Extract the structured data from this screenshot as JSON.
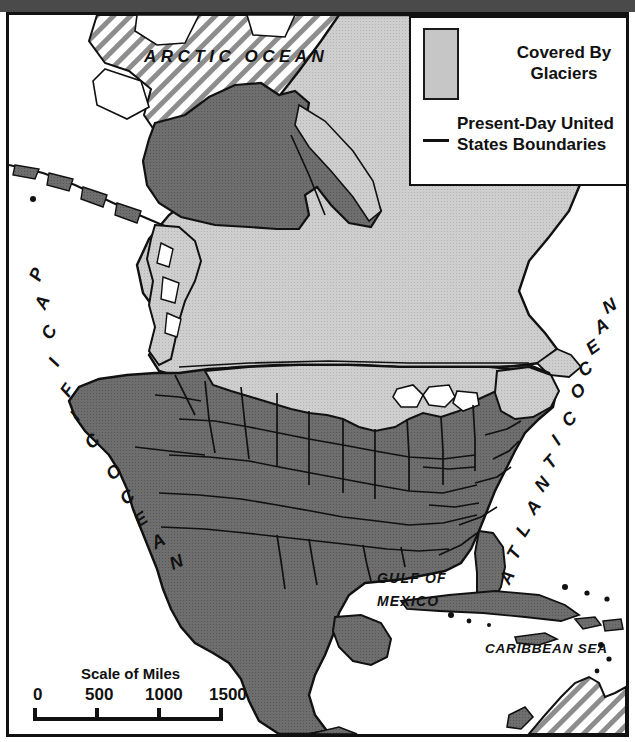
{
  "map": {
    "title": "Ice Age Glaciation of North America",
    "legend": {
      "glacier_label": "Covered By Glaciers",
      "glacier_label_line1": "Covered By",
      "glacier_label_line2": "Glaciers",
      "boundary_label": "Present-Day United States Boundaries",
      "boundary_label_line1": "Present-Day United",
      "boundary_label_line2": "States Boundaries"
    },
    "water_labels": {
      "arctic": "ARCTIC OCEAN",
      "pacific": "PACIFIC OCEAN",
      "pacific_word1": "PACIFIC",
      "pacific_word2": "OCEAN",
      "atlantic": "ATLANTIC OCEAN",
      "atlantic_word1": "ATLANTIC",
      "atlantic_word2": "OCEAN",
      "gulf_line1": "GULF OF",
      "gulf_line2": "MEXICO",
      "caribbean": "CARIBBEAN SEA"
    },
    "scale": {
      "title": "Scale of Miles",
      "ticks": [
        "0",
        "500",
        "1000",
        "1500"
      ],
      "units": "miles",
      "max": 1500
    },
    "colors": {
      "glacier_fill": "#c6c6c6",
      "land_fill": "#6e6e6e",
      "water_fill": "#ffffff",
      "outline": "#111111",
      "hatch": "#8a8a8a",
      "top_band": "#4a4a4a"
    }
  }
}
